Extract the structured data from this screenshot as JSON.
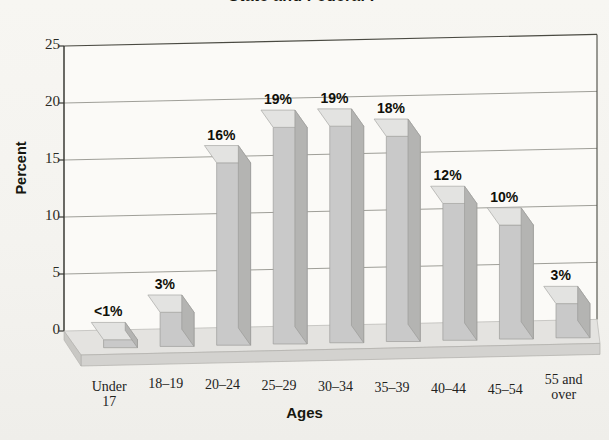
{
  "figure": {
    "title": "State and Federal P",
    "caption": "",
    "background_color": "#f6f5f1",
    "bar_front_color": "#c9c9c9",
    "bar_top_color": "#e3e3e1",
    "bar_side_color": "#b4b4b2",
    "floor_color": "#dedddb",
    "axis_color": "#3a3a34"
  },
  "chart_data": {
    "type": "bar",
    "title": "State and Federal P",
    "xlabel": "Ages",
    "ylabel": "Percent",
    "categories": [
      "Under 17",
      "18–19",
      "20–24",
      "25–29",
      "30–34",
      "35–39",
      "40–44",
      "45–54",
      "55 and over"
    ],
    "category_lines": [
      [
        "Under",
        "17"
      ],
      [
        "18–19"
      ],
      [
        "20–24"
      ],
      [
        "25–29"
      ],
      [
        "30–34"
      ],
      [
        "35–39"
      ],
      [
        "40–44"
      ],
      [
        "45–54"
      ],
      [
        "55 and",
        "over"
      ]
    ],
    "values": [
      0.7,
      3,
      16,
      19,
      19,
      18,
      12,
      10,
      3
    ],
    "data_labels": [
      "<1%",
      "3%",
      "16%",
      "19%",
      "19%",
      "18%",
      "12%",
      "10%",
      "3%"
    ],
    "ylim": [
      0,
      25
    ],
    "yticks": [
      0,
      5,
      10,
      15,
      20,
      25
    ],
    "ytick_labels": [
      "0",
      "5",
      "10",
      "15",
      "20",
      "25"
    ],
    "grid": true,
    "legend": null,
    "style": "3d-column"
  }
}
